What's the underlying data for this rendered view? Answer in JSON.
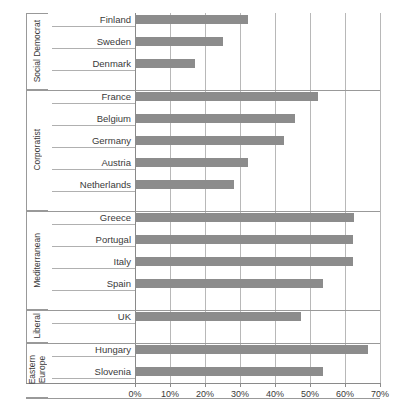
{
  "chart_data": {
    "type": "bar",
    "orientation": "horizontal",
    "title": "",
    "xlabel": "",
    "ylabel": "",
    "xlim": [
      0,
      70
    ],
    "xticks": [
      0,
      10,
      20,
      30,
      40,
      50,
      60,
      70
    ],
    "xtick_labels": [
      "0%",
      "10%",
      "20%",
      "30%",
      "40%",
      "50%",
      "60%",
      "70%"
    ],
    "grid": true,
    "legend": "none",
    "bar_color": "#8c8c8c",
    "groups": [
      {
        "name": "Social Democrat",
        "categories": [
          "Finland",
          "Sweden",
          "Denmark"
        ],
        "values": [
          32.3,
          25.1,
          17.1
        ]
      },
      {
        "name": "Corporatist",
        "categories": [
          "France",
          "Belgium",
          "Germany",
          "Austria",
          "Netherlands"
        ],
        "values": [
          52.3,
          45.7,
          42.6,
          32.3,
          28.3
        ]
      },
      {
        "name": "Mediterranean",
        "categories": [
          "Greece",
          "Portugal",
          "Italy",
          "Spain"
        ],
        "values": [
          62.6,
          62.3,
          62.3,
          53.7
        ]
      },
      {
        "name": "Liberal",
        "categories": [
          "UK"
        ],
        "values": [
          47.4
        ]
      },
      {
        "name": "Eastern\nEurope",
        "categories": [
          "Hungary",
          "Slovenia"
        ],
        "values": [
          66.6,
          53.7
        ]
      }
    ]
  }
}
